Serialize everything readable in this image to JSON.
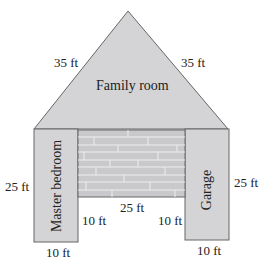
{
  "diagram": {
    "rooms": {
      "family_room": {
        "label": "Family room",
        "shape": "triangle"
      },
      "master_bedroom": {
        "label": "Master bedroom",
        "shape": "rectangle"
      },
      "garage": {
        "label": "Garage",
        "shape": "rectangle"
      },
      "patio": {
        "label": "",
        "shape": "rectangle",
        "pattern": "brick"
      }
    },
    "dimensions": {
      "triangle_left_side": "35 ft",
      "triangle_right_side": "35 ft",
      "bedroom_height": "25 ft",
      "garage_height": "25 ft",
      "patio_width": "25 ft",
      "bedroom_inner_gap": "10 ft",
      "garage_inner_gap": "10 ft",
      "bedroom_width": "10 ft",
      "garage_width": "10 ft"
    },
    "colors": {
      "fill": "#d4d4d6",
      "stroke": "#555555",
      "brick": "#c8c8ca",
      "brick_line": "#efefef"
    }
  }
}
